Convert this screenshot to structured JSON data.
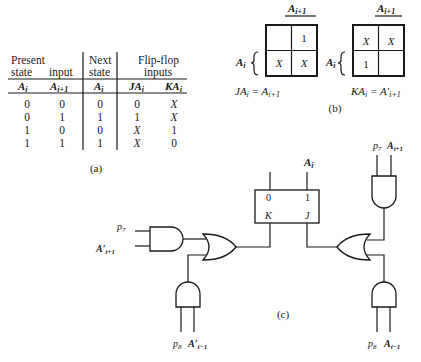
{
  "table": {
    "headers": {
      "present_state": [
        "Present",
        "state"
      ],
      "input": "input",
      "next_state": [
        "Next",
        "state"
      ],
      "flipflop_inputs": [
        "Flip-flop",
        "inputs"
      ]
    },
    "subheaders": [
      "A_i",
      "A_i+1",
      "A_i",
      "JA_i",
      "KA_i"
    ],
    "rows": [
      [
        "0",
        "0",
        "0",
        "0",
        "X"
      ],
      [
        "0",
        "1",
        "1",
        "1",
        "X"
      ],
      [
        "1",
        "0",
        "0",
        "X",
        "1"
      ],
      [
        "1",
        "1",
        "1",
        "X",
        "0"
      ]
    ],
    "caption": "(a)"
  },
  "kmaps": {
    "caption": "(b)",
    "col_label": "A",
    "col_sub": "i+1",
    "row_label": "A",
    "row_sub": "i",
    "j_map": {
      "cells": [
        "",
        "1",
        "X",
        "X"
      ],
      "equation_lhs": "JA",
      "equation_rhs": "A",
      "rhs_sub": "i+1"
    },
    "k_map": {
      "cells": [
        "X",
        "X",
        "1",
        ""
      ],
      "equation_lhs": "KA",
      "equation_rhs": "A′",
      "rhs_sub": "i+1"
    }
  },
  "circuit": {
    "caption": "(c)",
    "flipflop": {
      "out0": "0",
      "out1": "1",
      "k": "K",
      "j": "J",
      "output_label": "A",
      "output_sub": "i"
    },
    "inputs": {
      "left_and_top": [
        "p",
        "7",
        "A′",
        "i+1"
      ],
      "left_and_bottom": [
        "p",
        "8",
        "A′",
        "i−1"
      ],
      "right_and_top": [
        "p",
        "7",
        "A",
        "i+1"
      ],
      "right_and_bottom": [
        "p",
        "8",
        "A",
        "i−1"
      ]
    }
  }
}
